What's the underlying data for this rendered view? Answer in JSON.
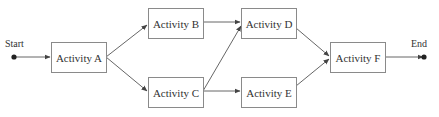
{
  "diagram": {
    "type": "activity-network",
    "start_label": "Start",
    "end_label": "End",
    "nodes": [
      {
        "id": "A",
        "label": "Activity A"
      },
      {
        "id": "B",
        "label": "Activity B"
      },
      {
        "id": "C",
        "label": "Activity C"
      },
      {
        "id": "D",
        "label": "Activity D"
      },
      {
        "id": "E",
        "label": "Activity E"
      },
      {
        "id": "F",
        "label": "Activity F"
      }
    ],
    "edges": [
      {
        "from": "Start",
        "to": "A"
      },
      {
        "from": "A",
        "to": "B"
      },
      {
        "from": "A",
        "to": "C"
      },
      {
        "from": "B",
        "to": "D"
      },
      {
        "from": "C",
        "to": "D"
      },
      {
        "from": "C",
        "to": "E"
      },
      {
        "from": "D",
        "to": "F"
      },
      {
        "from": "E",
        "to": "F"
      },
      {
        "from": "F",
        "to": "End"
      }
    ],
    "colors": {
      "line": "#555555",
      "box_border": "#8a8a8a",
      "text": "#333333"
    }
  }
}
